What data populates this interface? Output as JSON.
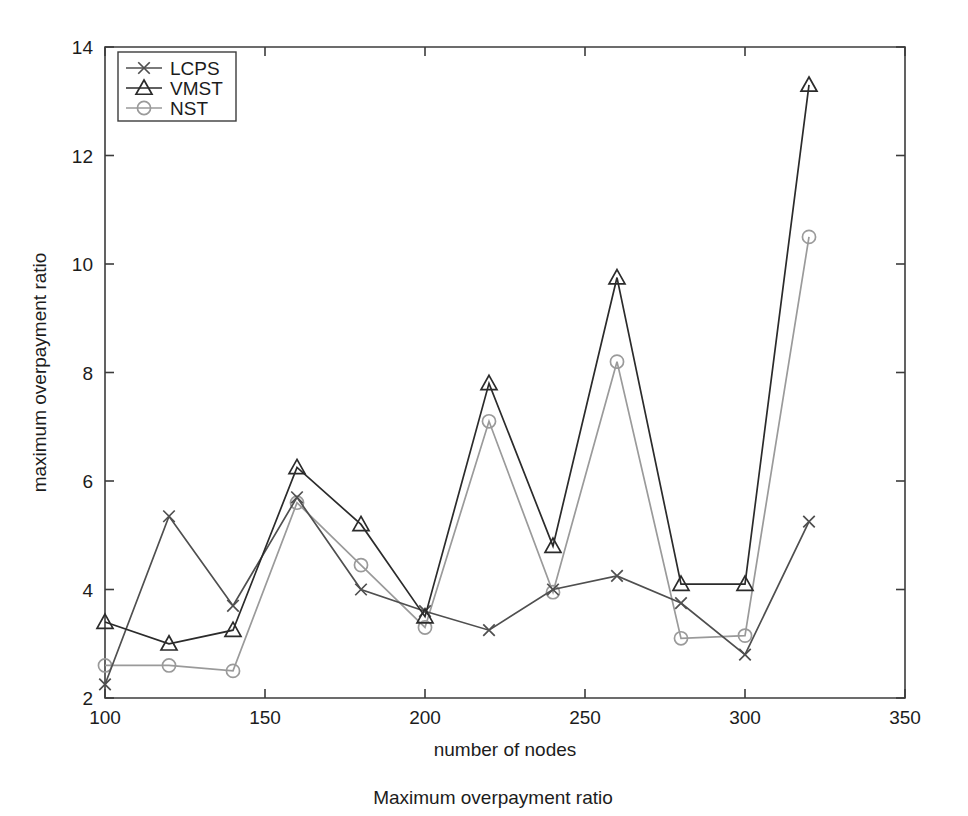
{
  "chart_data": {
    "type": "line",
    "title": "",
    "caption": "Maximum overpayment ratio",
    "xlabel": "number of nodes",
    "ylabel": "maximum overpayment ratio",
    "xlim": [
      100,
      350
    ],
    "ylim": [
      2,
      14
    ],
    "xticks": [
      100,
      150,
      200,
      250,
      300,
      350
    ],
    "yticks": [
      2,
      4,
      6,
      8,
      10,
      12,
      14
    ],
    "grid": false,
    "legend_position": "top-left",
    "x": [
      100,
      120,
      140,
      160,
      180,
      200,
      220,
      240,
      260,
      280,
      300,
      320
    ],
    "series": [
      {
        "name": "LCPS",
        "marker": "x",
        "color": "#4f4f4f",
        "values": [
          2.25,
          5.35,
          3.7,
          5.7,
          4.0,
          3.6,
          3.25,
          4.0,
          4.25,
          3.75,
          2.8,
          5.25
        ]
      },
      {
        "name": "VMST",
        "marker": "triangle",
        "color": "#2b2b2b",
        "values": [
          3.4,
          3.0,
          3.25,
          6.25,
          5.2,
          3.5,
          7.8,
          4.8,
          9.75,
          4.1,
          4.1,
          13.3
        ]
      },
      {
        "name": "NST",
        "marker": "circle",
        "color": "#9a9a9a",
        "values": [
          2.6,
          2.6,
          2.5,
          5.6,
          4.45,
          3.3,
          7.1,
          3.95,
          8.2,
          3.1,
          3.15,
          10.5
        ]
      }
    ]
  },
  "legend": {
    "entries": [
      {
        "label": "LCPS"
      },
      {
        "label": "VMST"
      },
      {
        "label": "NST"
      }
    ]
  },
  "xtick_labels": [
    "100",
    "150",
    "200",
    "250",
    "300",
    "350"
  ],
  "ytick_labels": [
    "2",
    "4",
    "6",
    "8",
    "10",
    "12",
    "14"
  ]
}
